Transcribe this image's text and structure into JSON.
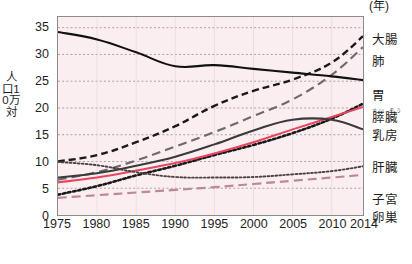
{
  "chart_data": {
    "type": "line",
    "title": "",
    "xlabel": "年",
    "ylabel": "人口10万対",
    "x": [
      1975,
      1980,
      1985,
      1990,
      1995,
      2000,
      2005,
      2010,
      2014
    ],
    "xlim": [
      1975,
      2014
    ],
    "ylim": [
      0,
      37
    ],
    "yticks": [
      0,
      5,
      10,
      15,
      20,
      25,
      30,
      35
    ],
    "xticks": [
      "1975",
      "1980",
      "1985",
      "1990",
      "1995",
      "2000",
      "2005",
      "2010",
      "2014"
    ],
    "grid": true,
    "legend_position": "right",
    "series": [
      {
        "name": "大腸",
        "style": "dashed",
        "color": "#1a1a1a",
        "values": [
          10.0,
          11.2,
          13.6,
          16.6,
          20.4,
          23.2,
          25.3,
          28.5,
          33.4
        ]
      },
      {
        "name": "肺",
        "style": "long-dashed",
        "color": "#6e6b6b",
        "values": [
          6.6,
          8.0,
          10.2,
          12.8,
          15.5,
          18.5,
          21.6,
          26.2,
          31.4
        ]
      },
      {
        "name": "胃",
        "style": "solid",
        "color": "#111111",
        "values": [
          34.2,
          32.8,
          30.4,
          27.8,
          28.0,
          27.3,
          26.6,
          25.9,
          25.2
        ]
      },
      {
        "name": "膵臓",
        "ruby": "すい ぞう",
        "style": "dotted",
        "color": "#1a1a1a",
        "values": [
          3.8,
          5.4,
          7.4,
          9.2,
          11.2,
          13.1,
          15.3,
          18.0,
          20.8
        ]
      },
      {
        "name": "乳房",
        "style": "solid",
        "color": "#e8455f",
        "values": [
          6.1,
          7.0,
          8.3,
          9.7,
          11.5,
          13.6,
          16.0,
          18.3,
          20.2
        ]
      },
      {
        "name": "肝臓",
        "style": "solid",
        "color": "#3a3a3a",
        "values": [
          7.0,
          7.8,
          9.2,
          10.9,
          13.2,
          15.8,
          17.8,
          17.8,
          16.0
        ]
      },
      {
        "name": "子宮",
        "style": "fine-dotted",
        "color": "#4d4040",
        "values": [
          9.9,
          9.3,
          8.0,
          7.1,
          7.0,
          7.1,
          7.6,
          8.2,
          9.1
        ]
      },
      {
        "name": "卵巣",
        "style": "long-dashed",
        "color": "#b98a92",
        "values": [
          3.2,
          3.7,
          4.2,
          4.7,
          5.2,
          5.8,
          6.4,
          7.0,
          7.5
        ]
      }
    ]
  },
  "axis": {
    "y_title": "人口10万対",
    "y_ticks": [
      "35",
      "30",
      "25",
      "20",
      "15",
      "10",
      "5",
      "0"
    ],
    "x_ticks": [
      "1975",
      "1980",
      "1985",
      "1990",
      "1995",
      "2000",
      "2005",
      "2010",
      "2014"
    ],
    "x_unit": "(年)"
  },
  "legend": {
    "items": [
      {
        "label": "大腸",
        "ruby": ""
      },
      {
        "label": "肺",
        "ruby": ""
      },
      {
        "label": "胃",
        "ruby": ""
      },
      {
        "label": "膵臓",
        "ruby": "すい ぞう"
      },
      {
        "label": "乳房",
        "ruby": ""
      },
      {
        "label": "肝臓",
        "ruby": ""
      },
      {
        "label": "子宮",
        "ruby": ""
      },
      {
        "label": "卵巣",
        "ruby": ""
      }
    ]
  },
  "top_strip": {
    "text": ""
  },
  "colors": {
    "plot_background": "#fbeef1",
    "plot_border": "#8c8c8c",
    "grid": "#8b7f82",
    "breast_line": "#e8455f"
  }
}
